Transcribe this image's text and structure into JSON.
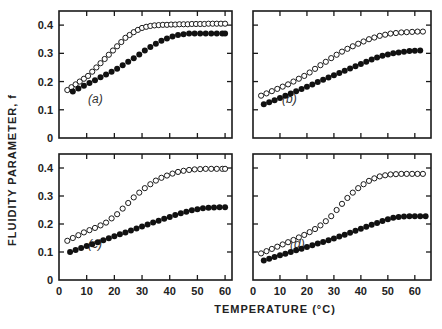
{
  "figure": {
    "ylabel": "FLUIDITY PARAMETER, f",
    "xlabel": "TEMPERATURE (°C)",
    "colors": {
      "axis": "#1a1a1a",
      "open_marker": "#1a1a1a",
      "filled_marker": "#111111"
    }
  },
  "chart_data": [
    {
      "type": "scatter",
      "panel": "(a)",
      "xlabel": "TEMPERATURE (°C)",
      "ylabel": "FLUIDITY PARAMETER, f",
      "xlim": [
        0,
        62.5
      ],
      "ylim": [
        0,
        0.45
      ],
      "xticks": [
        10,
        20,
        30,
        40,
        50,
        60
      ],
      "yticks": [
        0,
        0.1,
        0.2,
        0.3,
        0.4
      ],
      "ytick_labels": [
        "0",
        "0.1",
        "0.2",
        "0.3",
        "0.4"
      ],
      "series": [
        {
          "name": "open circles",
          "marker": "open",
          "x": [
            3,
            4.5,
            6,
            7.5,
            9,
            10.5,
            12,
            13.5,
            15,
            16.5,
            18,
            19.5,
            21,
            22.5,
            24,
            25.5,
            27,
            28.5,
            30,
            31.5,
            33,
            34.5,
            36,
            37.5,
            39,
            40.5,
            42,
            43.5,
            45,
            46.5,
            48,
            49.5,
            51,
            52.5,
            54,
            55.5,
            57,
            58.5,
            60
          ],
          "y": [
            0.17,
            0.18,
            0.19,
            0.2,
            0.21,
            0.22,
            0.235,
            0.25,
            0.265,
            0.28,
            0.295,
            0.31,
            0.325,
            0.34,
            0.355,
            0.365,
            0.375,
            0.383,
            0.39,
            0.394,
            0.397,
            0.399,
            0.4,
            0.401,
            0.401,
            0.402,
            0.402,
            0.403,
            0.403,
            0.403,
            0.404,
            0.404,
            0.404,
            0.404,
            0.405,
            0.405,
            0.405,
            0.405,
            0.405
          ]
        },
        {
          "name": "filled circles",
          "marker": "filled",
          "x": [
            5,
            7,
            9,
            11,
            13,
            15,
            17,
            19,
            21,
            23,
            25,
            27,
            29,
            31,
            33,
            35,
            37,
            39,
            41,
            43,
            45,
            47,
            49,
            51,
            53,
            55,
            57,
            59,
            60
          ],
          "y": [
            0.165,
            0.175,
            0.185,
            0.195,
            0.205,
            0.215,
            0.225,
            0.235,
            0.245,
            0.258,
            0.27,
            0.283,
            0.296,
            0.31,
            0.322,
            0.334,
            0.345,
            0.353,
            0.36,
            0.365,
            0.368,
            0.37,
            0.37,
            0.37,
            0.37,
            0.37,
            0.37,
            0.37,
            0.37
          ]
        }
      ]
    },
    {
      "type": "scatter",
      "panel": "(b)",
      "xlim": [
        0,
        66
      ],
      "ylim": [
        0,
        0.45
      ],
      "xticks": [
        10,
        20,
        30,
        40,
        50,
        60
      ],
      "yticks": [
        0,
        0.1,
        0.2,
        0.3,
        0.4
      ],
      "series": [
        {
          "name": "open circles",
          "marker": "open",
          "x": [
            3,
            5,
            7,
            9,
            11,
            13,
            15,
            17,
            19,
            21,
            23,
            25,
            27,
            29,
            31,
            33,
            35,
            37,
            39,
            41,
            43,
            45,
            47,
            49,
            51,
            53,
            55,
            57,
            59,
            61,
            63
          ],
          "y": [
            0.15,
            0.158,
            0.166,
            0.174,
            0.182,
            0.19,
            0.2,
            0.21,
            0.22,
            0.232,
            0.245,
            0.258,
            0.27,
            0.283,
            0.295,
            0.306,
            0.316,
            0.325,
            0.334,
            0.342,
            0.35,
            0.356,
            0.362,
            0.366,
            0.37,
            0.372,
            0.374,
            0.375,
            0.376,
            0.377,
            0.377
          ]
        },
        {
          "name": "filled circles",
          "marker": "filled",
          "x": [
            4,
            6,
            8,
            10,
            12,
            14,
            16,
            18,
            20,
            22,
            24,
            26,
            28,
            30,
            32,
            34,
            36,
            38,
            40,
            42,
            44,
            46,
            48,
            50,
            52,
            54,
            56,
            58,
            60,
            62
          ],
          "y": [
            0.12,
            0.127,
            0.134,
            0.142,
            0.15,
            0.158,
            0.166,
            0.174,
            0.182,
            0.19,
            0.198,
            0.206,
            0.214,
            0.222,
            0.23,
            0.238,
            0.246,
            0.254,
            0.262,
            0.27,
            0.278,
            0.285,
            0.291,
            0.296,
            0.3,
            0.303,
            0.306,
            0.308,
            0.309,
            0.31
          ]
        }
      ]
    },
    {
      "type": "scatter",
      "panel": "(c)",
      "xlim": [
        0,
        62.5
      ],
      "ylim": [
        0,
        0.45
      ],
      "xticks": [
        0,
        10,
        20,
        30,
        40,
        50,
        60
      ],
      "xtick_labels": [
        "0",
        "10",
        "20",
        "30",
        "40",
        "50",
        "60"
      ],
      "yticks": [
        0,
        0.1,
        0.2,
        0.3,
        0.4
      ],
      "ytick_labels": [
        "0",
        "0.1",
        "0.2",
        "0.3",
        "0.4"
      ],
      "series": [
        {
          "name": "open circles",
          "marker": "open",
          "x": [
            3,
            5,
            7,
            9,
            11,
            13,
            15,
            17,
            19,
            21,
            23,
            25,
            27,
            29,
            31,
            33,
            35,
            37,
            39,
            41,
            43,
            45,
            47,
            49,
            51,
            53,
            55,
            57,
            59,
            60
          ],
          "y": [
            0.14,
            0.15,
            0.16,
            0.17,
            0.178,
            0.186,
            0.195,
            0.205,
            0.22,
            0.235,
            0.255,
            0.275,
            0.295,
            0.312,
            0.328,
            0.342,
            0.355,
            0.365,
            0.373,
            0.38,
            0.386,
            0.39,
            0.393,
            0.395,
            0.396,
            0.397,
            0.397,
            0.397,
            0.397,
            0.397
          ]
        },
        {
          "name": "filled circles",
          "marker": "filled",
          "x": [
            4,
            6,
            8,
            10,
            12,
            14,
            16,
            18,
            20,
            22,
            24,
            26,
            28,
            30,
            32,
            34,
            36,
            38,
            40,
            42,
            44,
            46,
            48,
            50,
            52,
            54,
            56,
            58,
            60
          ],
          "y": [
            0.1,
            0.107,
            0.114,
            0.121,
            0.128,
            0.135,
            0.142,
            0.149,
            0.156,
            0.163,
            0.17,
            0.177,
            0.184,
            0.191,
            0.198,
            0.205,
            0.212,
            0.219,
            0.225,
            0.232,
            0.238,
            0.244,
            0.249,
            0.253,
            0.256,
            0.258,
            0.259,
            0.26,
            0.26
          ]
        }
      ]
    },
    {
      "type": "scatter",
      "panel": "(d)",
      "xlim": [
        0,
        66
      ],
      "ylim": [
        0,
        0.45
      ],
      "xticks": [
        0,
        10,
        20,
        30,
        40,
        50,
        60
      ],
      "xtick_labels": [
        "0",
        "10",
        "20",
        "30",
        "40",
        "50",
        "60"
      ],
      "yticks": [
        0,
        0.1,
        0.2,
        0.3,
        0.4
      ],
      "series": [
        {
          "name": "open circles",
          "marker": "open",
          "x": [
            3,
            5,
            7,
            9,
            11,
            13,
            15,
            17,
            19,
            21,
            23,
            25,
            27,
            29,
            31,
            33,
            35,
            37,
            39,
            41,
            43,
            45,
            47,
            49,
            51,
            53,
            55,
            57,
            59,
            61,
            63
          ],
          "y": [
            0.095,
            0.103,
            0.111,
            0.119,
            0.127,
            0.135,
            0.143,
            0.152,
            0.161,
            0.171,
            0.182,
            0.195,
            0.21,
            0.228,
            0.25,
            0.272,
            0.293,
            0.312,
            0.328,
            0.342,
            0.354,
            0.363,
            0.37,
            0.374,
            0.377,
            0.378,
            0.379,
            0.379,
            0.379,
            0.379,
            0.379
          ]
        },
        {
          "name": "filled circles",
          "marker": "filled",
          "x": [
            4,
            6,
            8,
            10,
            12,
            14,
            16,
            18,
            20,
            22,
            24,
            26,
            28,
            30,
            32,
            34,
            36,
            38,
            40,
            42,
            44,
            46,
            48,
            50,
            52,
            54,
            56,
            58,
            60,
            62,
            64
          ],
          "y": [
            0.07,
            0.076,
            0.082,
            0.088,
            0.094,
            0.1,
            0.106,
            0.112,
            0.118,
            0.124,
            0.13,
            0.136,
            0.142,
            0.148,
            0.155,
            0.162,
            0.169,
            0.176,
            0.183,
            0.19,
            0.197,
            0.204,
            0.211,
            0.217,
            0.222,
            0.225,
            0.227,
            0.228,
            0.228,
            0.228,
            0.228
          ]
        }
      ]
    }
  ]
}
